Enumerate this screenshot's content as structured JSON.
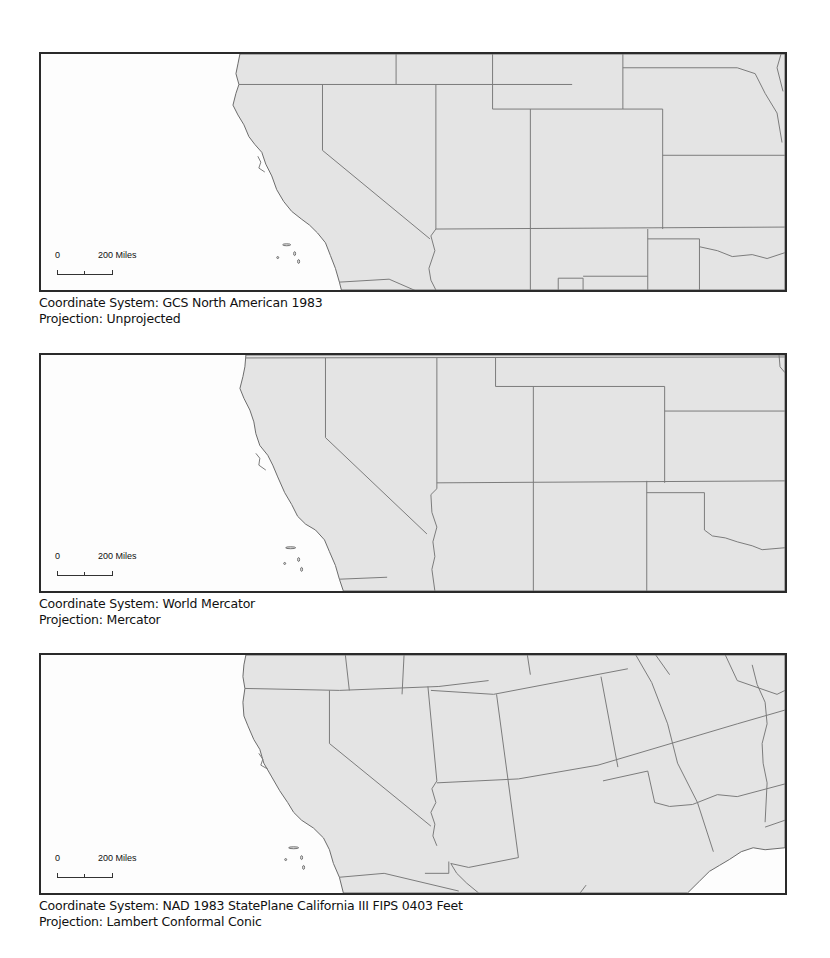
{
  "figure": {
    "panels": [
      {
        "id": "unprojected",
        "scale_bar": {
          "zero_label": "0",
          "distance_label": "200 Miles"
        },
        "coordinate_system_label": "Coordinate System: GCS North American 1983",
        "projection_label": "Projection: Unprojected"
      },
      {
        "id": "mercator",
        "scale_bar": {
          "zero_label": "0",
          "distance_label": "200 Miles"
        },
        "coordinate_system_label": "Coordinate System: World Mercator",
        "projection_label": "Projection: Mercator"
      },
      {
        "id": "lambert",
        "scale_bar": {
          "zero_label": "0",
          "distance_label": "200 Miles"
        },
        "coordinate_system_label": "Coordinate System: NAD 1983 StatePlane California III FIPS 0403 Feet",
        "projection_label": "Projection: Lambert Conformal Conic"
      }
    ],
    "colors": {
      "land": "#e4e4e4",
      "water": "#fdfdfd",
      "state_border": "#7a7a7a",
      "frame": "#2a2a2a"
    }
  }
}
